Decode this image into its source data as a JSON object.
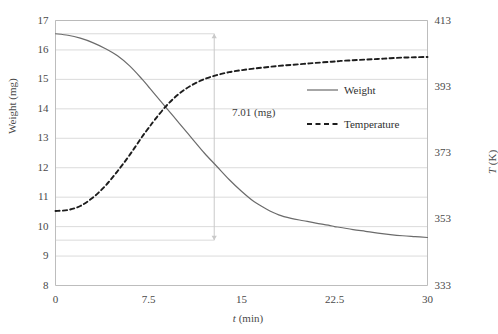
{
  "chart_data": {
    "type": "line",
    "title": "",
    "xlabel": "t (min)",
    "xlabel_italic_symbol": "t",
    "xlabel_unit": "(min)",
    "ylabel_left": "Weight (mg)",
    "ylabel_right": "T (K)",
    "ylabel_right_italic_symbol": "T",
    "ylabel_right_unit": "(K)",
    "xlim": [
      0,
      30
    ],
    "ylim_left": [
      8,
      17
    ],
    "ylim_right": [
      333,
      413
    ],
    "xticks": [
      "0",
      "7.5",
      "15",
      "22.5",
      "30"
    ],
    "xtick_values": [
      0,
      7.5,
      15,
      22.5,
      30
    ],
    "yticks_left": [
      "17",
      "16",
      "15",
      "14",
      "13",
      "12",
      "11",
      "10",
      "9",
      "8"
    ],
    "ytick_left_values": [
      17,
      16,
      15,
      14,
      13,
      12,
      11,
      10,
      9,
      8
    ],
    "yticks_right": [
      "413",
      "393",
      "373",
      "353",
      "333"
    ],
    "ytick_right_values": [
      413,
      393,
      373,
      353,
      333
    ],
    "grid": "horizontal",
    "legend_position": "center-right",
    "legend": [
      {
        "name": "Weight",
        "style": "solid",
        "color": "#6b6b6b",
        "axis": "left"
      },
      {
        "name": "Temperature",
        "style": "dashed",
        "color": "#1d1d1d",
        "axis": "right"
      }
    ],
    "annotations": [
      {
        "text": "7.01 (mg)",
        "type": "double-headed-vertical-arrow",
        "x": 12.8,
        "y_top": 16.55,
        "y_bottom": 9.54,
        "delta": 7.01,
        "unit": "mg"
      }
    ],
    "series": [
      {
        "name": "Weight",
        "axis": "left",
        "unit": "mg",
        "x": [
          0,
          1,
          2,
          3,
          4,
          5,
          6,
          7,
          7.5,
          8,
          9,
          10,
          11,
          12,
          13,
          14,
          15,
          16,
          17,
          18,
          19,
          20,
          21,
          22,
          22.5,
          23,
          24,
          25,
          26,
          27,
          28,
          29,
          30
        ],
        "values": [
          16.55,
          16.5,
          16.4,
          16.25,
          16.05,
          15.8,
          15.45,
          15.0,
          14.75,
          14.5,
          14.0,
          13.5,
          13.0,
          12.5,
          12.05,
          11.6,
          11.2,
          10.85,
          10.6,
          10.4,
          10.28,
          10.2,
          10.12,
          10.05,
          10.0,
          9.97,
          9.9,
          9.84,
          9.78,
          9.73,
          9.69,
          9.66,
          9.63
        ]
      },
      {
        "name": "Temperature",
        "axis": "right",
        "unit": "K",
        "x": [
          0,
          1,
          2,
          3,
          4,
          5,
          6,
          7,
          7.5,
          8,
          9,
          10,
          11,
          12,
          13,
          14,
          15,
          16,
          17,
          18,
          19,
          20,
          21,
          22,
          22.5,
          23,
          24,
          25,
          26,
          27,
          28,
          29,
          30
        ],
        "values": [
          355.5,
          355.8,
          357.0,
          359.5,
          363.0,
          367.5,
          372.5,
          378.0,
          380.5,
          383.0,
          387.5,
          391.0,
          393.5,
          395.3,
          396.5,
          397.4,
          398.0,
          398.5,
          398.9,
          399.3,
          399.6,
          399.9,
          400.2,
          400.5,
          400.6,
          400.8,
          401.0,
          401.2,
          401.4,
          401.6,
          401.8,
          401.9,
          402.0
        ]
      }
    ]
  },
  "colors": {
    "weight_line": "#6b6b6b",
    "temperature_line": "#1d1d1d",
    "grid": "#d2d2d2",
    "frame": "#b5b5b5",
    "arrow": "#c9c9c9",
    "text": "#4a4a4a"
  }
}
